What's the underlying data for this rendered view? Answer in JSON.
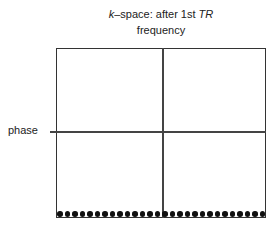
{
  "title": {
    "k": "k",
    "middle": "–space: after 1st ",
    "tr": "TR"
  },
  "axes": {
    "frequency_label": "frequency",
    "phase_label": "phase"
  },
  "grid": {
    "quadrants": 4,
    "filled_row": "bottom",
    "dot_count": 28,
    "dot_color": "#111111",
    "line_color": "#333333"
  }
}
